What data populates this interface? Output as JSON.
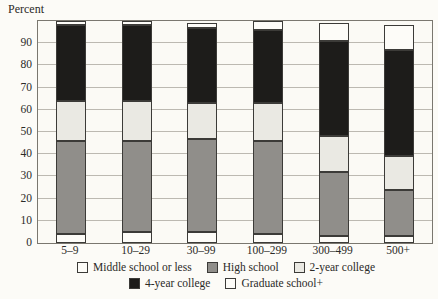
{
  "chart_data": {
    "type": "bar",
    "stacked": true,
    "ylabel": "Percent",
    "categories": [
      "5–9",
      "10–29",
      "30–99",
      "100–299",
      "300–499",
      "500+"
    ],
    "series": [
      {
        "name": "Middle school or less",
        "color": "#fdfcf8",
        "values": [
          4,
          5,
          5,
          4,
          3,
          3
        ]
      },
      {
        "name": "High school",
        "color": "#908e8a",
        "values": [
          42,
          41,
          42,
          42,
          29,
          21
        ]
      },
      {
        "name": "2-year college",
        "color": "#eae9e3",
        "values": [
          18,
          18,
          16,
          17,
          16,
          15
        ]
      },
      {
        "name": "4-year college",
        "color": "#1d1c1a",
        "values": [
          34,
          34,
          34,
          33,
          43,
          48
        ]
      },
      {
        "name": "Graduate school+",
        "color": "#fdfcf8",
        "values": [
          2,
          2,
          2,
          4,
          8,
          11
        ]
      }
    ],
    "ylim": [
      0,
      100
    ],
    "yticks": [
      0,
      10,
      20,
      30,
      40,
      50,
      60,
      70,
      80,
      90
    ],
    "grid": true,
    "legend_position": "bottom",
    "legend_rows": [
      [
        0,
        1,
        2
      ],
      [
        3,
        4
      ]
    ]
  }
}
